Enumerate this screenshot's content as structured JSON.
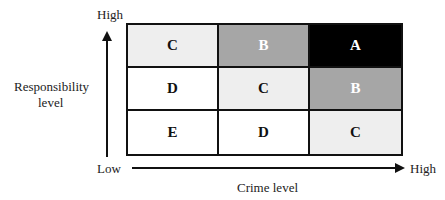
{
  "y_axis": {
    "title_line1": "Responsibility",
    "title_line2": "level",
    "high_label": "High",
    "low_label": "Low"
  },
  "x_axis": {
    "title": "Crime level",
    "high_label": "High"
  },
  "matrix": {
    "rows": [
      [
        {
          "label": "C",
          "bg": "#eeeeee",
          "fg": "#111111"
        },
        {
          "label": "B",
          "bg": "#a6a6a6",
          "fg": "#ffffff"
        },
        {
          "label": "A",
          "bg": "#000000",
          "fg": "#ffffff"
        }
      ],
      [
        {
          "label": "D",
          "bg": "#ffffff",
          "fg": "#111111"
        },
        {
          "label": "C",
          "bg": "#eeeeee",
          "fg": "#111111"
        },
        {
          "label": "B",
          "bg": "#a6a6a6",
          "fg": "#ffffff"
        }
      ],
      [
        {
          "label": "E",
          "bg": "#ffffff",
          "fg": "#111111"
        },
        {
          "label": "D",
          "bg": "#ffffff",
          "fg": "#111111"
        },
        {
          "label": "C",
          "bg": "#eeeeee",
          "fg": "#111111"
        }
      ]
    ]
  }
}
